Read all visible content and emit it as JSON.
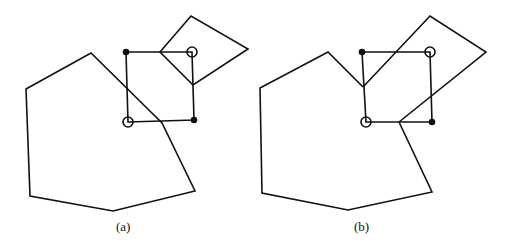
{
  "figures": [
    {
      "id": "a",
      "caption": "(a)",
      "polygon": [
        [
          26,
          89
        ],
        [
          91,
          53
        ],
        [
          162,
          123
        ],
        [
          195,
          191
        ],
        [
          113,
          211
        ],
        [
          30,
          196
        ]
      ],
      "square": {
        "corners": [
          [
            126,
            52
          ],
          [
            192,
            52
          ],
          [
            194,
            120
          ],
          [
            128,
            122
          ]
        ],
        "filled_dots": [
          [
            126,
            52
          ],
          [
            194,
            120
          ]
        ],
        "open_circles": [
          [
            192,
            52
          ],
          [
            128,
            122
          ]
        ]
      },
      "quad": [
        [
          160,
          52
        ],
        [
          191,
          16
        ],
        [
          248,
          49
        ],
        [
          193,
          85
        ]
      ]
    },
    {
      "id": "b",
      "caption": "(b)",
      "polygon": [
        [
          260,
          88
        ],
        [
          328,
          52
        ],
        [
          363,
          87
        ],
        [
          366,
          122
        ],
        [
          399,
          122
        ],
        [
          432,
          192
        ],
        [
          348,
          210
        ],
        [
          262,
          193
        ]
      ],
      "square": {
        "corners": [
          [
            362,
            52
          ],
          [
            430,
            52
          ],
          [
            432,
            122
          ],
          [
            366,
            122
          ]
        ],
        "filled_dots": [
          [
            362,
            52
          ],
          [
            432,
            122
          ]
        ],
        "open_circles": [
          [
            430,
            52
          ],
          [
            366,
            122
          ]
        ]
      },
      "quad": [
        [
          363,
          87
        ],
        [
          430,
          16
        ],
        [
          486,
          52
        ],
        [
          399,
          122
        ]
      ]
    }
  ]
}
